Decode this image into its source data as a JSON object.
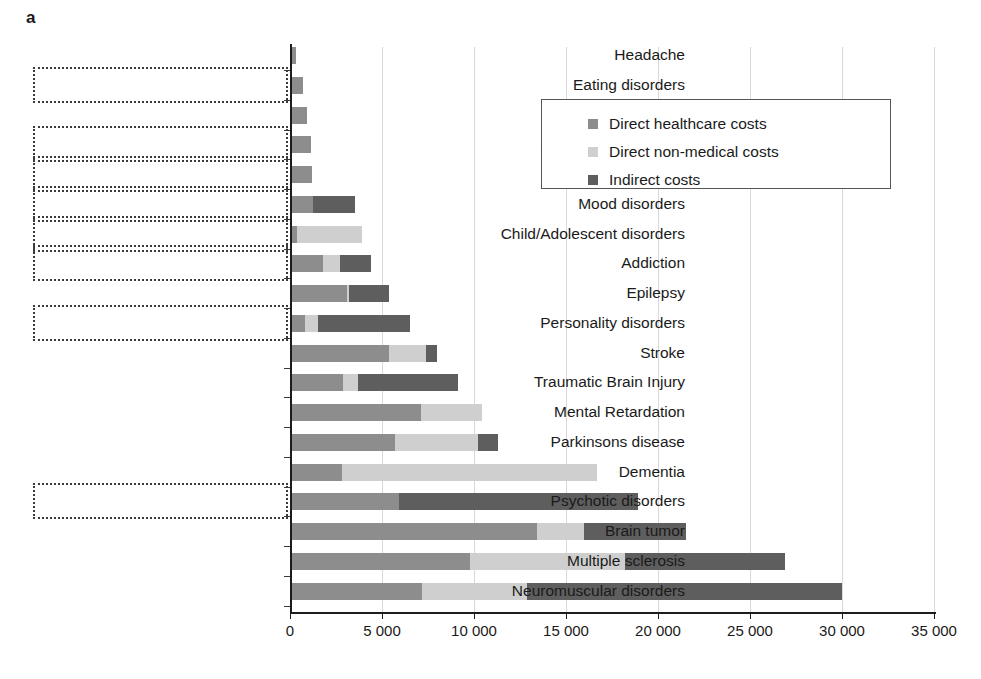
{
  "panel": {
    "letter": "a"
  },
  "legend": {
    "position": "inside-top-right",
    "items": [
      {
        "label": "Direct healthcare costs",
        "color": "#8d8d8d",
        "key": "direct_healthcare"
      },
      {
        "label": "Direct non-medical costs",
        "color": "#cfcfcf",
        "key": "direct_non_medical"
      },
      {
        "label": "Indirect costs",
        "color": "#5e5e5e",
        "key": "indirect"
      }
    ]
  },
  "axis": {
    "ticks": [
      {
        "value": 0,
        "label": "0"
      },
      {
        "value": 5000,
        "label": "5 000"
      },
      {
        "value": 10000,
        "label": "10 000"
      },
      {
        "value": 15000,
        "label": "15 000"
      },
      {
        "value": 20000,
        "label": "20 000"
      },
      {
        "value": 25000,
        "label": "25 000"
      },
      {
        "value": 30000,
        "label": "30 000"
      },
      {
        "value": 35000,
        "label": "35 000"
      }
    ]
  },
  "highlighted_categories": [
    "Eating disorders",
    "Somatoform disorder",
    "Anxiety disorders",
    "Mood disorders",
    "Child/Adolescent disorders",
    "Addiction",
    "Personality disorders",
    "Psychotic disorders"
  ],
  "chart_data": {
    "type": "bar",
    "orientation": "horizontal",
    "stacked": true,
    "title": "",
    "xlabel": "",
    "ylabel": "",
    "xlim": [
      0,
      35000
    ],
    "grid": "vertical",
    "legend_position": "inside-top-right",
    "categories": [
      "Headache",
      "Eating disorders",
      "Sleep disorders",
      "Somatoform disorder",
      "Anxiety disorders",
      "Mood disorders",
      "Child/Adolescent disorders",
      "Addiction",
      "Epilepsy",
      "Personality disorders",
      "Stroke",
      "Traumatic Brain Injury",
      "Mental Retardation",
      "Parkinsons disease",
      "Dementia",
      "Psychotic disorders",
      "Brain tumor",
      "Multiple sclerosis",
      "Neuromuscular disorders"
    ],
    "series": [
      {
        "name": "Direct healthcare costs",
        "color": "#8d8d8d",
        "values": [
          350,
          700,
          950,
          1150,
          1200,
          1250,
          400,
          1800,
          3100,
          800,
          5400,
          2900,
          7100,
          5700,
          2800,
          5900,
          13400,
          9800,
          7200
        ]
      },
      {
        "name": "Direct non-medical costs",
        "color": "#cfcfcf",
        "values": [
          0,
          0,
          0,
          0,
          0,
          0,
          3500,
          900,
          100,
          700,
          2000,
          800,
          3350,
          4500,
          13900,
          0,
          2600,
          8400,
          5700
        ]
      },
      {
        "name": "Indirect costs",
        "color": "#5e5e5e",
        "values": [
          0,
          0,
          0,
          0,
          0,
          2300,
          0,
          1700,
          2200,
          5000,
          600,
          5450,
          0,
          1100,
          0,
          13000,
          5500,
          8700,
          17100
        ]
      }
    ],
    "totals": [
      350,
      700,
      950,
      1150,
      1200,
      3550,
      3900,
      4400,
      5400,
      6500,
      8000,
      9150,
      10450,
      11300,
      16700,
      18900,
      21500,
      26900,
      30000
    ]
  }
}
